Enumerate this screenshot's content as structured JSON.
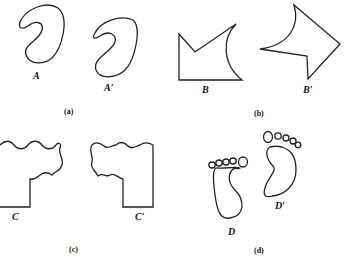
{
  "figure": {
    "panels": [
      {
        "id": "a",
        "caption": "(a)",
        "shape": "loop-curve",
        "labels": [
          "A",
          "A′"
        ]
      },
      {
        "id": "b",
        "caption": "(b)",
        "shape": "arrow-polygon",
        "labels": [
          "B",
          "B′"
        ]
      },
      {
        "id": "c",
        "caption": "(c)",
        "shape": "wavy-L",
        "labels": [
          "C",
          "C′"
        ]
      },
      {
        "id": "d",
        "caption": "(d)",
        "shape": "footprint",
        "labels": [
          "D",
          "D′"
        ]
      }
    ]
  }
}
